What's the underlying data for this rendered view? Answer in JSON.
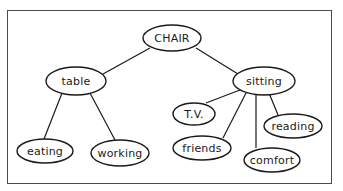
{
  "diagram": {
    "type": "concept-map",
    "root": "CHAIR",
    "colors": {
      "line": "#1a1a1a",
      "background": "#ffffff",
      "frame": "#4a4a4a"
    },
    "nodes": [
      {
        "id": "chair",
        "label": "CHAIR",
        "cx": 172,
        "cy": 38,
        "rx": 29,
        "ry": 13
      },
      {
        "id": "table",
        "label": "table",
        "cx": 76,
        "cy": 81,
        "rx": 30,
        "ry": 14
      },
      {
        "id": "sitting",
        "label": "sitting",
        "cx": 264,
        "cy": 81,
        "rx": 31,
        "ry": 14
      },
      {
        "id": "eating",
        "label": "eating",
        "cx": 45,
        "cy": 151,
        "rx": 28,
        "ry": 12
      },
      {
        "id": "working",
        "label": "working",
        "cx": 120,
        "cy": 153,
        "rx": 29,
        "ry": 13
      },
      {
        "id": "tv",
        "label": "T.V.",
        "cx": 194,
        "cy": 114,
        "rx": 21,
        "ry": 11
      },
      {
        "id": "friends",
        "label": "friends",
        "cx": 202,
        "cy": 148,
        "rx": 29,
        "ry": 12
      },
      {
        "id": "comfort",
        "label": "comfort",
        "cx": 272,
        "cy": 160,
        "rx": 28,
        "ry": 12
      },
      {
        "id": "reading",
        "label": "reading",
        "cx": 293,
        "cy": 126,
        "rx": 29,
        "ry": 12
      }
    ],
    "edges": [
      {
        "from": "chair",
        "to": "table",
        "x1": 150,
        "y1": 48,
        "x2": 103,
        "y2": 74
      },
      {
        "from": "chair",
        "to": "sitting",
        "x1": 196,
        "y1": 48,
        "x2": 238,
        "y2": 74
      },
      {
        "from": "table",
        "to": "eating",
        "x1": 62,
        "y1": 93,
        "x2": 44,
        "y2": 139
      },
      {
        "from": "table",
        "to": "working",
        "x1": 90,
        "y1": 93,
        "x2": 115,
        "y2": 140
      },
      {
        "from": "sitting",
        "to": "tv",
        "x1": 240,
        "y1": 90,
        "x2": 206,
        "y2": 103
      },
      {
        "from": "sitting",
        "to": "friends",
        "x1": 246,
        "y1": 93,
        "x2": 223,
        "y2": 138
      },
      {
        "from": "sitting",
        "to": "comfort",
        "x1": 256,
        "y1": 94,
        "x2": 256,
        "y2": 148
      },
      {
        "from": "sitting",
        "to": "reading",
        "x1": 269,
        "y1": 93,
        "x2": 278,
        "y2": 115
      }
    ]
  }
}
